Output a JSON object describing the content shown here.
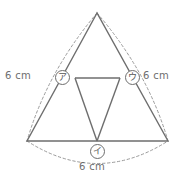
{
  "figure": {
    "stroke_color": "#6e6e6e",
    "dash_color": "#9a9a9a",
    "background_color": "#ffffff"
  },
  "labels": {
    "left_measure": "6 cm",
    "right_measure": "6 cm",
    "bottom_measure": "6 cm"
  },
  "markers": {
    "left": "ア",
    "right": "ウ",
    "bottom": "イ"
  },
  "geometry": {
    "apex": {
      "x": 97,
      "y": 13
    },
    "bottom_left": {
      "x": 27,
      "y": 141
    },
    "bottom_right": {
      "x": 168,
      "y": 141
    },
    "mid_left": {
      "x": 62,
      "y": 77
    },
    "mid_right": {
      "x": 132,
      "y": 77
    },
    "mid_bottom": {
      "x": 97,
      "y": 141
    },
    "inner_left": {
      "x": 75,
      "y": 78
    },
    "inner_right": {
      "x": 120,
      "y": 78
    }
  },
  "paths": {
    "outer_triangle": "M 97 13 L 27 141 L 168 141 Z",
    "midline_horizontal": "M 75 78 L 120 78",
    "midline_left_to_bottom": "M 75 78 L 97 141",
    "midline_right_to_bottom": "M 120 78 L 97 141",
    "left_arc": "M 97 13 Q 47 72 27 141",
    "right_arc": "M 97 13 Q 148 72 168 141",
    "bottom_arc": "M 27 141 Q 97 186 168 141"
  }
}
